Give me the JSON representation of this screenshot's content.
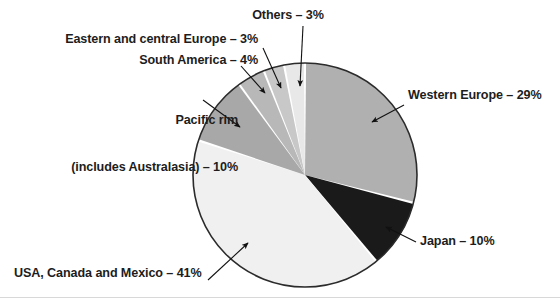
{
  "chart_data": {
    "type": "pie",
    "title": "",
    "subtitle": "",
    "xlabel": "",
    "ylabel": "",
    "legend_position": "callout-labels",
    "grid": false,
    "units": "%",
    "start_angle_deg": 0,
    "direction": "clockwise",
    "center": {
      "x": 305,
      "y": 175
    },
    "radius": 112,
    "categories": [
      "Western Europe",
      "Japan",
      "USA, Canada and Mexico",
      "Pacific rim (includes Australasia)",
      "South America",
      "Eastern and central Europe",
      "Others"
    ],
    "values": [
      29,
      10,
      41,
      10,
      4,
      3,
      3
    ],
    "slices": [
      {
        "name": "Western Europe",
        "value": 29,
        "color": "#b0b0b0",
        "label_text": "Western Europe – 29%",
        "label_lines": [
          "Western Europe – 29%"
        ],
        "label_align": "left",
        "leader": {
          "x1": 404,
          "y1": 105,
          "x2": 372,
          "y2": 122
        }
      },
      {
        "name": "Japan",
        "value": 10,
        "color": "#1a1a1a",
        "label_text": "Japan – 10%",
        "label_lines": [
          "Japan – 10%"
        ],
        "label_align": "left",
        "leader": {
          "x1": 416,
          "y1": 242,
          "x2": 386,
          "y2": 227
        }
      },
      {
        "name": "USA, Canada and Mexico",
        "value": 41,
        "color": "#f0f0f0",
        "label_text": "USA, Canada and Mexico – 41%",
        "label_lines": [
          "USA, Canada and Mexico – 41%"
        ],
        "label_align": "left",
        "leader": {
          "x1": 208,
          "y1": 280,
          "x2": 248,
          "y2": 243
        }
      },
      {
        "name": "Pacific rim (includes Australasia)",
        "value": 10,
        "color": "#a8a8a8",
        "label_text": "Pacific rim\n(includes Australasia) – 10%",
        "label_lines": [
          "Pacific rim",
          "(includes Australasia) – 10%"
        ],
        "label_align": "right",
        "leader": {
          "x1": 203,
          "y1": 100,
          "x2": 240,
          "y2": 127
        }
      },
      {
        "name": "South America",
        "value": 4,
        "color": "#b8b8b8",
        "label_text": "South America – 4%",
        "label_lines": [
          "South America – 4%"
        ],
        "label_align": "right",
        "leader": {
          "x1": 241,
          "y1": 66,
          "x2": 265,
          "y2": 93
        }
      },
      {
        "name": "Eastern and central Europe",
        "value": 3,
        "color": "#c8c8c8",
        "label_text": "Eastern and central Europe – 3%",
        "label_lines": [
          "Eastern and central Europe – 3%"
        ],
        "label_align": "right",
        "leader": {
          "x1": 263,
          "y1": 48,
          "x2": 281,
          "y2": 88
        }
      },
      {
        "name": "Others",
        "value": 3,
        "color": "#e8e8e8",
        "label_text": "Others – 3%",
        "label_lines": [
          "Others – 3%"
        ],
        "label_align": "center",
        "leader": {
          "x1": 303,
          "y1": 26,
          "x2": 300,
          "y2": 86
        }
      }
    ]
  },
  "labels": {
    "others": "Others – 3%",
    "eastern_europe": "Eastern and central Europe – 3%",
    "south_america": "South America – 4%",
    "pacific_rim_line1": "Pacific rim",
    "pacific_rim_line2": "(includes Australasia) – 10%",
    "western_europe": "Western Europe – 29%",
    "japan": "Japan – 10%",
    "usa_canada_mexico": "USA, Canada and Mexico – 41%"
  },
  "colors": {
    "western_europe": "#b0b0b0",
    "japan": "#1a1a1a",
    "usa_canada_mexico": "#f0f0f0",
    "pacific_rim": "#a8a8a8",
    "south_america": "#b8b8b8",
    "eastern_europe": "#c8c8c8",
    "others": "#e8e8e8",
    "outline": "#2b2b2b",
    "separator": "#ffffff",
    "text": "#1d1d1d",
    "background": "#ffffff"
  }
}
